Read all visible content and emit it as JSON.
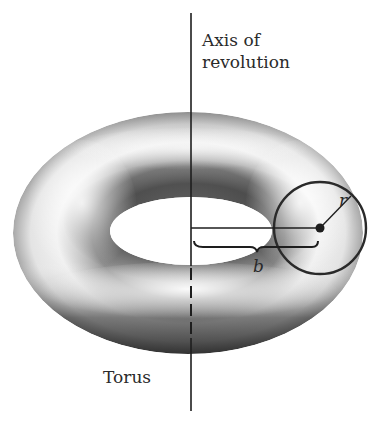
{
  "figure": {
    "title": "Torus",
    "axis_label_line1": "Axis of",
    "axis_label_line2": "revolution",
    "torus_label": "Torus",
    "radius_var": "r",
    "distance_var": "b"
  },
  "geometry": {
    "axis_x": 191,
    "axis_top": 13,
    "axis_bottom": 411,
    "outer_center": [
      188,
      233
    ],
    "outer_radii": [
      175,
      121
    ],
    "hole_center": [
      191,
      231
    ],
    "hole_radii": [
      81,
      34
    ],
    "cross_section_center": [
      320,
      228
    ],
    "cross_section_radius": 46
  },
  "colors": {
    "ink": "#1e1e1e",
    "shade_dark": "#3a3a3a",
    "shade_light": "#f4f4f4",
    "background": "#ffffff"
  }
}
